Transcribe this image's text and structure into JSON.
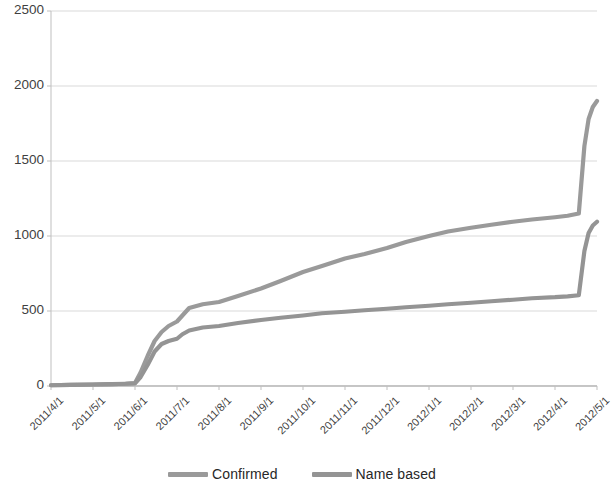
{
  "chart_data": {
    "type": "line",
    "title": "",
    "subtitle": "",
    "xlabel": "",
    "ylabel": "",
    "grid": true,
    "legend_position": "bottom",
    "ylim": [
      0,
      2500
    ],
    "yticks": [
      0,
      500,
      1000,
      1500,
      2000,
      2500
    ],
    "ytick_labels": [
      "0",
      "500",
      "1000",
      "1500",
      "2000",
      "2500"
    ],
    "xticks": [
      "2011/4/1",
      "2011/5/1",
      "2011/6/1",
      "2011/7/1",
      "2011/8/1",
      "2011/9/1",
      "2011/10/1",
      "2011/11/1",
      "2011/12/1",
      "2012/1/1",
      "2012/2/1",
      "2012/3/1",
      "2012/4/1",
      "2012/5/1"
    ],
    "x": [
      "2011/4/1",
      "2011/4/15",
      "2011/5/1",
      "2011/5/15",
      "2011/5/25",
      "2011/6/1",
      "2011/6/5",
      "2011/6/10",
      "2011/6/15",
      "2011/6/20",
      "2011/6/25",
      "2011/7/1",
      "2011/7/5",
      "2011/7/10",
      "2011/7/20",
      "2011/8/1",
      "2011/8/15",
      "2011/9/1",
      "2011/9/15",
      "2011/10/1",
      "2011/10/15",
      "2011/11/1",
      "2011/11/15",
      "2011/12/1",
      "2011/12/15",
      "2012/1/1",
      "2012/1/15",
      "2012/2/1",
      "2012/2/15",
      "2012/3/1",
      "2012/3/15",
      "2012/4/1",
      "2012/4/10",
      "2012/4/18",
      "2012/4/22",
      "2012/4/25",
      "2012/4/28",
      "2012/5/1"
    ],
    "series": [
      {
        "name": "Confirmed",
        "color": "#9a9a9a",
        "values": [
          5,
          8,
          10,
          12,
          15,
          20,
          90,
          200,
          300,
          360,
          400,
          430,
          470,
          520,
          545,
          560,
          600,
          650,
          700,
          760,
          800,
          850,
          880,
          920,
          960,
          1000,
          1030,
          1055,
          1075,
          1095,
          1110,
          1125,
          1135,
          1150,
          1600,
          1780,
          1860,
          1900
        ]
      },
      {
        "name": "Name based",
        "color": "#949494",
        "values": [
          5,
          8,
          10,
          12,
          15,
          18,
          60,
          140,
          230,
          280,
          300,
          315,
          345,
          370,
          390,
          400,
          420,
          440,
          455,
          470,
          485,
          495,
          505,
          515,
          525,
          535,
          545,
          555,
          565,
          575,
          585,
          592,
          598,
          605,
          900,
          1020,
          1070,
          1095
        ]
      }
    ],
    "legend": [
      {
        "label": "Confirmed",
        "color": "#9a9a9a"
      },
      {
        "label": "Name based",
        "color": "#949494"
      }
    ]
  },
  "axis": {
    "axis_color": "#bfbfbf",
    "grid_color": "#d9d9d9"
  }
}
